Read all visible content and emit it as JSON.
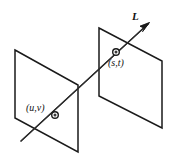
{
  "figure": {
    "name": "two-plane-light-field-parameterization",
    "background_color": "#ffffff",
    "stroke_color": "#1a1a1a",
    "width": 173,
    "height": 164,
    "labels": {
      "ray": "L",
      "front_plane_point": "(u,v)",
      "back_plane_point": "(s,t)"
    },
    "planes": [
      {
        "name": "front-plane",
        "label": "(u,v)",
        "corners": [
          [
            15,
            50
          ],
          [
            78,
            85
          ],
          [
            78,
            152
          ],
          [
            15,
            118
          ]
        ],
        "point": [
          55,
          115
        ]
      },
      {
        "name": "back-plane",
        "label": "(s,t)",
        "corners": [
          [
            99,
            28
          ],
          [
            162,
            61
          ],
          [
            162,
            128
          ],
          [
            99,
            96
          ]
        ],
        "point": [
          116,
          52
        ]
      }
    ],
    "ray": {
      "name": "L",
      "start": [
        21,
        141
      ],
      "end": [
        148,
        24
      ],
      "arrow_at": "end",
      "passes_through": [
        "(u,v)",
        "(s,t)"
      ]
    }
  }
}
